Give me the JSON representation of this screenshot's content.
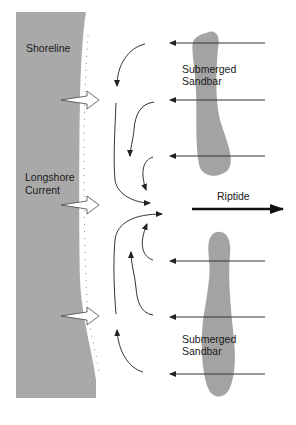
{
  "diagram": {
    "labels": {
      "shoreline": "Shoreline",
      "longshore_line1": "Longshore",
      "longshore_line2": "Current",
      "sandbar_top_line1": "Submerged",
      "sandbar_top_line2": "Sandbar",
      "sandbar_bottom_line1": "Submerged",
      "sandbar_bottom_line2": "Sandbar",
      "riptide": "Riptide"
    },
    "colors": {
      "shore": "#a9a9a9",
      "sandbar": "#a3a3a3",
      "line": "#333333",
      "riptide_arrow": "#111111"
    },
    "incoming_wave_arrows_y": [
      43,
      100,
      156,
      261,
      317,
      374
    ],
    "shore_hollow_arrows_y": [
      100,
      205,
      316
    ]
  }
}
